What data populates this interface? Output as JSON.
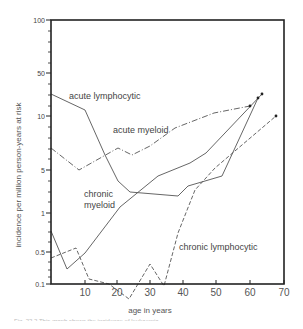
{
  "chart_data": {
    "type": "line",
    "title": "",
    "xlabel": "age in years",
    "ylabel": "incidence per million person-years at risk",
    "xlim": [
      0,
      70
    ],
    "ylim": [
      0.1,
      100
    ],
    "yscale": "log",
    "x_ticks": [
      "10",
      "20",
      "30",
      "40",
      "50",
      "60",
      "70"
    ],
    "y_ticks": [
      "0.1",
      "0.5",
      "1",
      "5",
      "10",
      "50",
      "100"
    ],
    "series": [
      {
        "name": "acute lymphocytic",
        "style": "solid",
        "x": [
          0,
          8,
          15,
          20,
          25,
          35,
          45,
          55,
          63
        ],
        "y": [
          25,
          13,
          4,
          2.2,
          2.0,
          2.0,
          4,
          7,
          20
        ]
      },
      {
        "name": "acute myeloid",
        "style": "dash-dot",
        "x": [
          0,
          8,
          20,
          24,
          35,
          45,
          55,
          60
        ],
        "y": [
          7,
          5,
          6.5,
          6,
          8,
          11,
          13,
          14
        ]
      },
      {
        "name": "chronic myeloid",
        "style": "solid",
        "x": [
          0,
          5,
          10,
          20,
          30,
          40,
          45,
          62
        ],
        "y": [
          0.7,
          0.25,
          0.5,
          1.3,
          2.3,
          3.5,
          5,
          20
        ]
      },
      {
        "name": "chronic lymphocytic",
        "style": "dashed",
        "x": [
          0,
          8,
          12,
          18,
          23,
          28,
          33,
          38,
          45,
          55,
          66
        ],
        "y": [
          0.5,
          0.7,
          0.3,
          0.18,
          0.1,
          0.35,
          0.15,
          1.0,
          2.5,
          4,
          9
        ]
      }
    ]
  },
  "labels": {
    "acute_lymphocytic": "acute lymphocytic",
    "acute_myeloid": "acute myeloid",
    "chronic_myeloid_1": "chronic",
    "chronic_myeloid_2": "myeloid",
    "chronic_lymphocytic": "chronic lymphocytic",
    "x_axis_title": "age in years",
    "y_axis_title": "incidence per million person-years at risk"
  },
  "render": {
    "plot": {
      "left": 51,
      "top": 20,
      "right": 284,
      "bottom": 284
    },
    "y_tick_pixels": [
      {
        "label": "100",
        "y": 20
      },
      {
        "label": "50",
        "y": 73
      },
      {
        "label": "10",
        "y": 116
      },
      {
        "label": "5",
        "y": 170
      },
      {
        "label": "1",
        "y": 213
      },
      {
        "label": "0.5",
        "y": 252
      },
      {
        "label": "0.1",
        "y": 284
      }
    ],
    "y_minor_pixels": [
      31,
      42,
      52,
      63,
      84,
      95,
      106,
      127,
      138,
      149,
      159,
      181,
      192,
      202,
      222,
      232,
      242,
      262,
      270,
      277
    ],
    "x_tick_pixels": [
      {
        "label": "10",
        "x": 85
      },
      {
        "label": "20",
        "x": 117
      },
      {
        "label": "30",
        "x": 150
      },
      {
        "label": "40",
        "x": 183
      },
      {
        "label": "50",
        "x": 216
      },
      {
        "label": "60",
        "x": 250
      },
      {
        "label": "70",
        "x": 284
      }
    ],
    "lines": [
      {
        "name": "acute-lymphocytic-line",
        "dash": "",
        "pts": "51,94 85,110 105,155 118,181 130,192 178,196 188,186 222,176 258,98"
      },
      {
        "name": "acute-myeloid-line",
        "dash": "6,2,1,2",
        "pts": "51,148 79,170 118,148 132,155 150,146 175,128 214,113 250,106"
      },
      {
        "name": "chronic-myeloid-line",
        "dash": "",
        "pts": "51,231 67,269 85,253 120,207 158,176 190,163 206,153 262,94"
      },
      {
        "name": "chronic-lymphocytic-line",
        "dash": "4,2",
        "pts": "51,258 76,248 89,279 109,284 129,299 150,264 164,286 178,233 195,190 215,168 276,116"
      }
    ],
    "endpoints": [
      {
        "x": 258,
        "y": 98
      },
      {
        "x": 250,
        "y": 106
      },
      {
        "x": 262,
        "y": 94
      },
      {
        "x": 276,
        "y": 116
      }
    ],
    "colors": {
      "axis": "#222222",
      "line": "#555555",
      "text": "#444444"
    }
  },
  "caption": "Fig. 22.2   This graph shows the incidence of leukaemia"
}
